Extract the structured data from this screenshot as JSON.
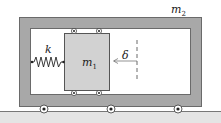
{
  "labels": {
    "m2": "m",
    "m2_sub": "2",
    "m1": "m",
    "m1_sub": "1",
    "k": "k",
    "delta": "δ"
  },
  "colors": {
    "frame": "#a8a8a8",
    "frame_stroke": "#6a6a6a",
    "block": "#d2d2d2",
    "ground": "#c8c8c8",
    "line": "#222222"
  }
}
